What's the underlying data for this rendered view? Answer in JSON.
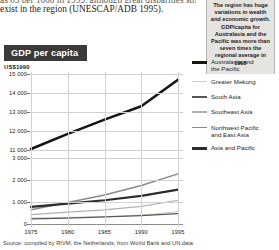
{
  "prose": {
    "line_clipped": "as 65 per 1000 in 1995, although great disparities still",
    "line_2": "exist in the region (UNESCAP/ADB 1995)."
  },
  "pullquote": {
    "text": "The region has huge variations in wealth and economic growth. GDP/capita for Australasia and the Pacific was more than seven times the regional average in 1995"
  },
  "source": {
    "text": "Source: compiled by RIVM, the Netherlands, from World Bank and UN data"
  },
  "colors": {
    "title_badge_bg": "#3b3a38",
    "pullquote_bg": "#e6e4e0",
    "grid": "#d3d1cd",
    "australasia": "#16150f",
    "greater_mekong": "#cdcbc7",
    "south_asia": "#5a5853",
    "southeast_asia": "#b3b1ac",
    "northwest_pacific": "#8c8a85",
    "asia_pacific": "#2e2d2a"
  },
  "chart_data": {
    "type": "line",
    "title": "GDP per capita",
    "ylabel": "US$1990",
    "xlabel": "",
    "broken_axis": true,
    "ylim_upper": [
      11000,
      15000
    ],
    "ylim_lower": [
      0,
      3000
    ],
    "yticks_upper": [
      "15 000",
      "14 000",
      "13 000",
      "12 000",
      "11 000"
    ],
    "yticks_lower": [
      "3 000",
      "2 000",
      "1 000",
      "0"
    ],
    "grid": true,
    "legend_position": "right",
    "x": [
      1975,
      1980,
      1985,
      1990,
      1995
    ],
    "xtick_labels": [
      "1975",
      "1980",
      "1985",
      "1990",
      "1995"
    ],
    "series": [
      {
        "name": "Australasia and the Pacific",
        "color": "#16150f",
        "width": 2.6,
        "panel": "upper",
        "values": [
          11050,
          11850,
          12600,
          13300,
          14700
        ]
      },
      {
        "name": "Greater Mekong",
        "color": "#cdcbc7",
        "width": 1.0,
        "panel": "lower",
        "values": [
          270,
          300,
          330,
          400,
          560
        ]
      },
      {
        "name": "South Asia",
        "color": "#5a5853",
        "width": 1.2,
        "panel": "lower",
        "values": [
          230,
          270,
          320,
          380,
          470
        ]
      },
      {
        "name": "Southeast Asia",
        "color": "#b3b1ac",
        "width": 1.2,
        "panel": "lower",
        "values": [
          430,
          540,
          640,
          800,
          1080
        ]
      },
      {
        "name": "Northwest Pacific and East Asia",
        "color": "#8c8a85",
        "width": 1.5,
        "panel": "lower",
        "values": [
          650,
          980,
          1320,
          1750,
          2280
        ]
      },
      {
        "name": "Asia and Pacific",
        "color": "#2e2d2a",
        "width": 2.2,
        "panel": "lower",
        "values": [
          780,
          930,
          1080,
          1280,
          1560
        ]
      }
    ]
  },
  "legend": {
    "items": [
      {
        "label_line1": "Australasia and",
        "label_line2": "the Pacific",
        "color": "#16150f",
        "thickness": 2.8
      },
      {
        "label_line1": "Greater Mekong",
        "label_line2": "",
        "color": "#cdcbc7",
        "thickness": 1.2
      },
      {
        "label_line1": "South Asia",
        "label_line2": "",
        "color": "#5a5853",
        "thickness": 1.8
      },
      {
        "label_line1": "Southeast Asia",
        "label_line2": "",
        "color": "#b3b1ac",
        "thickness": 1.2
      },
      {
        "label_line1": "Northwest Pacific",
        "label_line2": "and East Asia",
        "color": "#8c8a85",
        "thickness": 1.8
      },
      {
        "label_line1": "Asia and Pacific",
        "label_line2": "",
        "color": "#2e2d2a",
        "thickness": 3.0
      }
    ]
  }
}
